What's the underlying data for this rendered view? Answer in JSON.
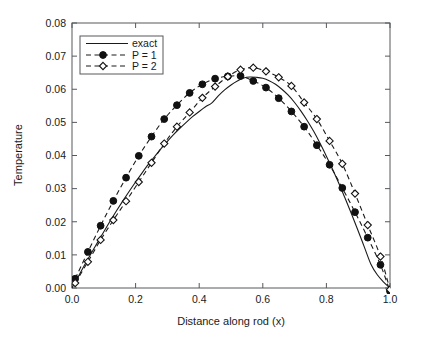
{
  "chart_data": {
    "type": "line",
    "title": "",
    "xlabel": "Distance along rod (x)",
    "ylabel": "Temperature",
    "xlim": [
      0.0,
      1.0
    ],
    "ylim": [
      0.0,
      0.08
    ],
    "grid": false,
    "legend_position": "upper left",
    "xticks": [
      "0.0",
      "0.2",
      "0.4",
      "0.6",
      "0.8",
      "1.0"
    ],
    "xtick_values": [
      0.0,
      0.2,
      0.4,
      0.6,
      0.8,
      1.0
    ],
    "yticks": [
      "0.00",
      "0.01",
      "0.02",
      "0.03",
      "0.04",
      "0.05",
      "0.06",
      "0.07",
      "0.08"
    ],
    "ytick_values": [
      0.0,
      0.01,
      0.02,
      0.03,
      0.04,
      0.05,
      0.06,
      0.07,
      0.08
    ],
    "series": [
      {
        "name": "exact",
        "style": "solid-line",
        "marker": "none",
        "color": "#1a1a1a",
        "x": [
          0.0,
          0.02,
          0.04,
          0.06,
          0.08,
          0.1,
          0.12,
          0.14,
          0.16,
          0.18,
          0.2,
          0.22,
          0.24,
          0.26,
          0.28,
          0.3,
          0.32,
          0.34,
          0.36,
          0.38,
          0.4,
          0.42,
          0.44,
          0.46,
          0.48,
          0.5,
          0.52,
          0.54,
          0.56,
          0.58,
          0.6,
          0.62,
          0.64,
          0.66,
          0.68,
          0.7,
          0.72,
          0.74,
          0.76,
          0.78,
          0.8,
          0.82,
          0.84,
          0.86,
          0.88,
          0.9,
          0.92,
          0.94,
          0.96,
          0.98,
          1.0
        ],
        "y": [
          0.0,
          0.0035,
          0.007,
          0.0104,
          0.0137,
          0.017,
          0.0202,
          0.0233,
          0.0263,
          0.0292,
          0.032,
          0.0347,
          0.0373,
          0.0397,
          0.0421,
          0.0443,
          0.0464,
          0.0483,
          0.0501,
          0.0518,
          0.0533,
          0.0547,
          0.0559,
          0.058,
          0.0598,
          0.0613,
          0.0625,
          0.0634,
          0.0637,
          0.0636,
          0.0633,
          0.0626,
          0.0615,
          0.06,
          0.0582,
          0.056,
          0.0534,
          0.0505,
          0.0473,
          0.0437,
          0.0398,
          0.0357,
          0.0314,
          0.0268,
          0.0221,
          0.0172,
          0.0122,
          0.0072,
          0.004,
          0.0018,
          0.0
        ]
      },
      {
        "name": "P = 1",
        "style": "dashed-line",
        "marker": "filled-circle",
        "color": "#1a1a1a",
        "x": [
          0.01,
          0.05,
          0.09,
          0.13,
          0.17,
          0.21,
          0.25,
          0.29,
          0.33,
          0.37,
          0.41,
          0.45,
          0.49,
          0.53,
          0.57,
          0.61,
          0.65,
          0.69,
          0.73,
          0.77,
          0.81,
          0.85,
          0.89,
          0.93,
          0.97,
          1.0
        ],
        "y": [
          0.0028,
          0.0109,
          0.0188,
          0.0263,
          0.0333,
          0.0399,
          0.0457,
          0.051,
          0.0552,
          0.0589,
          0.0615,
          0.0632,
          0.0639,
          0.064,
          0.0625,
          0.0605,
          0.0573,
          0.0533,
          0.0487,
          0.0431,
          0.0372,
          0.0302,
          0.0229,
          0.0152,
          0.007,
          -0.001
        ]
      },
      {
        "name": "P = 2",
        "style": "dashed-line",
        "marker": "open-diamond",
        "color": "#1a1a1a",
        "x": [
          0.01,
          0.05,
          0.09,
          0.13,
          0.17,
          0.21,
          0.25,
          0.29,
          0.33,
          0.37,
          0.41,
          0.45,
          0.49,
          0.53,
          0.57,
          0.61,
          0.65,
          0.69,
          0.73,
          0.77,
          0.81,
          0.85,
          0.89,
          0.93,
          0.97,
          1.0
        ],
        "y": [
          0.0015,
          0.0079,
          0.0145,
          0.0205,
          0.0262,
          0.032,
          0.0378,
          0.0436,
          0.0487,
          0.053,
          0.0574,
          0.0608,
          0.0638,
          0.0659,
          0.0665,
          0.0654,
          0.0636,
          0.061,
          0.056,
          0.051,
          0.0444,
          0.0375,
          0.0285,
          0.019,
          0.0095,
          -0.0005
        ]
      }
    ]
  },
  "legend": {
    "entries": [
      {
        "label": "exact"
      },
      {
        "label": "P = 1"
      },
      {
        "label": "P = 2"
      }
    ]
  }
}
